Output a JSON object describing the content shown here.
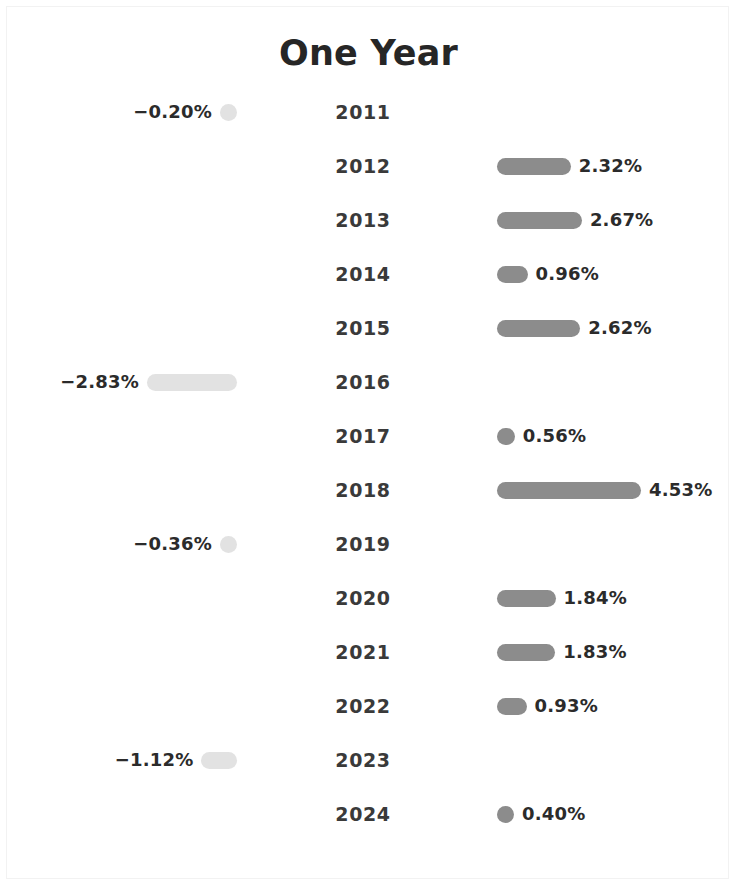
{
  "chart_data": {
    "type": "bar",
    "title": "One Year",
    "orientation": "horizontal-diverging",
    "xlabel": "",
    "ylabel": "",
    "grid": false,
    "legend": null,
    "value_suffix": "%",
    "baseline": 0,
    "xlim": [
      -3.2,
      5.0
    ],
    "colors": {
      "positive_bar": "#8c8c8c",
      "negative_bar": "#e2e2e2",
      "value_label": "#2b2b2b",
      "year_label": "#3a3a3a",
      "title": "#262626",
      "background": "#ffffff",
      "frame": "#f2f2f2"
    },
    "categories": [
      "2011",
      "2012",
      "2013",
      "2014",
      "2015",
      "2016",
      "2017",
      "2018",
      "2019",
      "2020",
      "2021",
      "2022",
      "2023",
      "2024"
    ],
    "values": [
      -0.2,
      2.32,
      2.67,
      0.96,
      2.62,
      -2.83,
      0.56,
      4.53,
      -0.36,
      1.84,
      1.83,
      0.93,
      -1.12,
      0.4
    ],
    "value_labels": [
      "−0.20%",
      "2.32%",
      "2.67%",
      "0.96%",
      "2.62%",
      "−2.83%",
      "0.56%",
      "4.53%",
      "−0.36%",
      "1.84%",
      "1.83%",
      "0.93%",
      "−1.12%",
      "0.40%"
    ]
  },
  "rows": [
    {
      "year": "2011",
      "value": -0.2,
      "label": "−0.20%",
      "sign": "negative"
    },
    {
      "year": "2012",
      "value": 2.32,
      "label": "2.32%",
      "sign": "positive"
    },
    {
      "year": "2013",
      "value": 2.67,
      "label": "2.67%",
      "sign": "positive"
    },
    {
      "year": "2014",
      "value": 0.96,
      "label": "0.96%",
      "sign": "positive"
    },
    {
      "year": "2015",
      "value": 2.62,
      "label": "2.62%",
      "sign": "positive"
    },
    {
      "year": "2016",
      "value": -2.83,
      "label": "−2.83%",
      "sign": "negative"
    },
    {
      "year": "2017",
      "value": 0.56,
      "label": "0.56%",
      "sign": "positive"
    },
    {
      "year": "2018",
      "value": 4.53,
      "label": "4.53%",
      "sign": "positive"
    },
    {
      "year": "2019",
      "value": -0.36,
      "label": "−0.36%",
      "sign": "negative"
    },
    {
      "year": "2020",
      "value": 1.84,
      "label": "1.84%",
      "sign": "positive"
    },
    {
      "year": "2021",
      "value": 1.83,
      "label": "1.83%",
      "sign": "positive"
    },
    {
      "year": "2022",
      "value": 0.93,
      "label": "0.93%",
      "sign": "positive"
    },
    {
      "year": "2023",
      "value": -1.12,
      "label": "−1.12%",
      "sign": "negative"
    },
    {
      "year": "2024",
      "value": 0.4,
      "label": "0.40%",
      "sign": "positive"
    }
  ],
  "layout": {
    "first_row_top": 92,
    "row_step": 54,
    "pos_baseline_x": 497,
    "neg_baseline_x": 237,
    "px_per_percent": 31.8,
    "min_bar_px": 17,
    "value_gap": 8
  }
}
